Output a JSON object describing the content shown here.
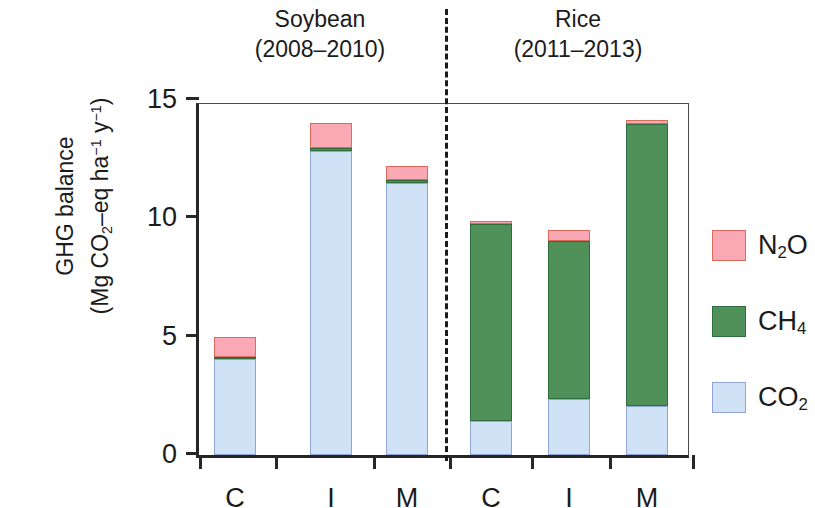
{
  "figure": {
    "groups": [
      {
        "name": "Soybean",
        "years": "(2008–2010)"
      },
      {
        "name": "Rice",
        "years": "(2011–2013)"
      }
    ],
    "y_axis_title_line1": "GHG balance",
    "y_axis_title_line2_prefix": "(Mg CO",
    "y_axis_title_line2_sub1": "2",
    "y_axis_title_line2_mid": "–eq ha",
    "y_axis_title_line2_sup1": "−1",
    "y_axis_title_line2_mid2": " y",
    "y_axis_title_line2_sup2": "−1",
    "y_axis_title_line2_suffix": ")",
    "colors": {
      "co2": "#cfe2f6",
      "co2_edge": "#8fa6d4",
      "ch4": "#4f9159",
      "ch4_edge": "#2f6d3c",
      "n2o": "#f9a8b4",
      "n2o_edge": "#d96a5c",
      "axis": "#262626"
    },
    "legend": [
      {
        "key": "n2o",
        "label_prefix": "N",
        "label_sub": "2",
        "label_suffix": "O"
      },
      {
        "key": "ch4",
        "label_prefix": "CH",
        "label_sub": "4",
        "label_suffix": ""
      },
      {
        "key": "co2",
        "label_prefix": "CO",
        "label_sub": "2",
        "label_suffix": ""
      }
    ]
  },
  "chart_data": {
    "type": "bar",
    "subtype": "stacked",
    "title": "",
    "xlabel": "",
    "ylabel": "GHG balance (Mg CO2-eq ha-1 y-1)",
    "ylim": [
      0,
      15
    ],
    "yticks": [
      0,
      5,
      10,
      15
    ],
    "ytick_labels": [
      "0",
      "5",
      "10",
      "15"
    ],
    "grid": false,
    "legend_position": "right",
    "groups": [
      "Soybean (2008–2010)",
      "Rice (2011–2013)"
    ],
    "categories": [
      "C",
      "I",
      "M",
      "C",
      "I",
      "M"
    ],
    "series": [
      {
        "name": "CO2",
        "values": [
          4.05,
          12.85,
          11.5,
          1.45,
          2.35,
          2.05
        ]
      },
      {
        "name": "CH4",
        "values": [
          0.1,
          0.12,
          0.1,
          8.3,
          6.7,
          11.95
        ]
      },
      {
        "name": "N2O",
        "values": [
          0.85,
          1.05,
          0.6,
          0.15,
          0.45,
          0.15
        ]
      }
    ],
    "totals": [
      5.0,
      14.02,
      12.2,
      9.9,
      9.5,
      14.15
    ],
    "bars": [
      {
        "label": "C",
        "group": "Soybean (2008–2010)",
        "co2": 4.05,
        "ch4": 0.1,
        "n2o": 0.85,
        "total": 5.0
      },
      {
        "label": "I",
        "group": "Soybean (2008–2010)",
        "co2": 12.85,
        "ch4": 0.12,
        "n2o": 1.05,
        "total": 14.02
      },
      {
        "label": "M",
        "group": "Soybean (2008–2010)",
        "co2": 11.5,
        "ch4": 0.1,
        "n2o": 0.6,
        "total": 12.2
      },
      {
        "label": "C",
        "group": "Rice (2011–2013)",
        "co2": 1.45,
        "ch4": 8.3,
        "n2o": 0.15,
        "total": 9.9
      },
      {
        "label": "I",
        "group": "Rice (2011–2013)",
        "co2": 2.35,
        "ch4": 6.7,
        "n2o": 0.45,
        "total": 9.5
      },
      {
        "label": "M",
        "group": "Rice (2011–2013)",
        "co2": 2.05,
        "ch4": 11.95,
        "n2o": 0.15,
        "total": 14.15
      }
    ]
  }
}
